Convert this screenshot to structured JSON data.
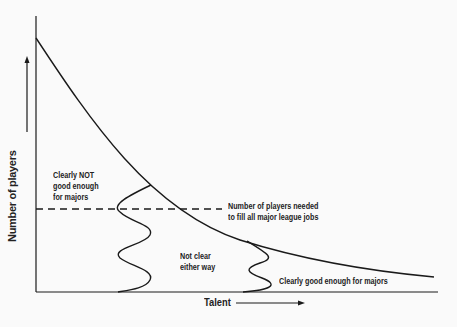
{
  "diagram": {
    "y_axis_label": "Number of players",
    "x_axis_label": "Talent",
    "labels": {
      "not_good": [
        "Clearly NOT",
        "good enough",
        "for majors"
      ],
      "threshold": [
        "Number of players needed",
        "to fill all major league jobs"
      ],
      "unclear": [
        "Not clear",
        "either way"
      ],
      "good": "Clearly good enough for majors"
    },
    "colors": {
      "line": "#1a1a1a",
      "background": "#fafafa"
    }
  }
}
